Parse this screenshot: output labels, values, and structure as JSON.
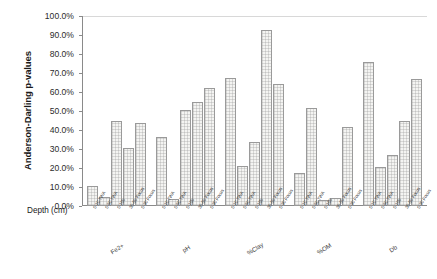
{
  "chart_data": {
    "type": "bar",
    "title": "",
    "xlabel": "Depth (cm)",
    "ylabel": "Anderson-Darling p-values",
    "ylim": [
      0,
      100
    ],
    "ytick_labels": [
      "100.0%",
      "90.0%",
      "80.0%",
      "70.0%",
      "60.0%",
      "50.0%",
      "40.0%",
      "30.0%",
      "20.0%",
      "10.0%",
      "0.0%"
    ],
    "ytick_values": [
      100,
      90,
      80,
      70,
      60,
      50,
      40,
      30,
      20,
      10,
      0
    ],
    "grid": false,
    "legend": "none",
    "categories": [
      "0-10 TWA",
      "0-50 TWA",
      "0-180",
      "30-50 Focus",
      "0-30 Focus"
    ],
    "group_labels": [
      "Fe2+",
      "pH",
      "%Clay",
      "%OM",
      "Db"
    ],
    "groups": [
      {
        "name": "Fe2+",
        "categories": [
          "0-10 TWA",
          "0-50 TWA",
          "0-180",
          "30-50 Focus",
          "0-30 Focus"
        ],
        "values": [
          10.5,
          4.5,
          44.5,
          30.5,
          43.5
        ]
      },
      {
        "name": "pH",
        "categories": [
          "0-10 TWA",
          "0-50 TWA",
          "0-180",
          "30-50 Focus",
          "0-30 Focus"
        ],
        "values": [
          36.5,
          3.5,
          50.5,
          55.0,
          62.0
        ]
      },
      {
        "name": "%Clay",
        "categories": [
          "0-10 TWA",
          "0-50 TWA",
          "0-180",
          "30-50 Focus",
          "0-30 Focus"
        ],
        "values": [
          67.5,
          21.0,
          33.5,
          92.5,
          64.0
        ]
      },
      {
        "name": "%OM",
        "categories": [
          "0-10 TWA",
          "0-50 TWA",
          "0-180",
          "30-50 Focus",
          "0-30 Focus"
        ],
        "values": [
          17.5,
          51.5,
          3.0,
          4.0,
          41.5
        ]
      },
      {
        "name": "Db",
        "categories": [
          "0-10 TWA",
          "0-50 TWA",
          "0-180",
          "30-50 Focus",
          "0-30 Focus"
        ],
        "values": [
          76.0,
          20.5,
          27.0,
          44.5,
          67.0
        ]
      }
    ]
  }
}
